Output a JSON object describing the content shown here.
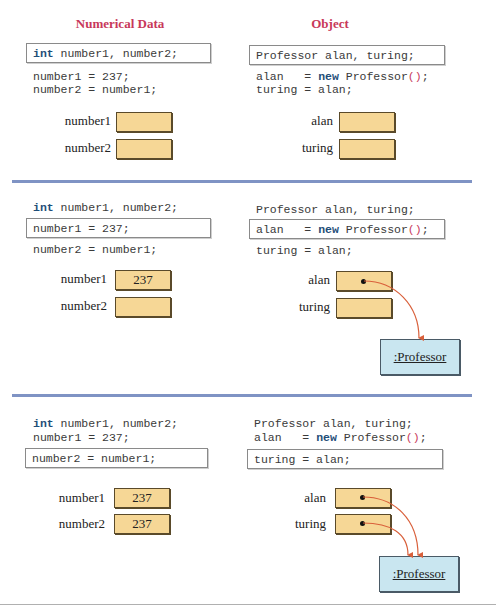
{
  "headings": {
    "left": "Numerical Data",
    "right": "Object"
  },
  "colors": {
    "heading": "#c8385a",
    "keyword": "#1f4e79",
    "cell_fill": "#f6d796",
    "object_fill": "#c9e6f0",
    "arrow": "#d9603b",
    "divider": "#7f93c4"
  },
  "code": {
    "left": {
      "decl_kw": "int",
      "decl_rest": " number1, number2;",
      "assign1": "number1 = 237;",
      "assign2": "number2 = number1;"
    },
    "right": {
      "decl": "Professor alan, turing;",
      "new_prefix": "alan   = ",
      "new_kw": "new",
      "new_class": " Professor",
      "new_parens": "()",
      "new_semi": ";",
      "assign": "turing = alan;"
    }
  },
  "variables": {
    "number1": "number1",
    "number2": "number2",
    "alan": "alan",
    "turing": "turing"
  },
  "panels": [
    {
      "highlight_left": "declaration",
      "highlight_right": "declaration",
      "number1_value": "",
      "number2_value": "",
      "object_label": ""
    },
    {
      "highlight_left": "number1 = 237",
      "highlight_right": "alan = new Professor()",
      "number1_value": "237",
      "number2_value": "",
      "object_label": ":Professor"
    },
    {
      "highlight_left": "number2 = number1",
      "highlight_right": "turing = alan",
      "number1_value": "237",
      "number2_value": "237",
      "object_label": ":Professor"
    }
  ]
}
